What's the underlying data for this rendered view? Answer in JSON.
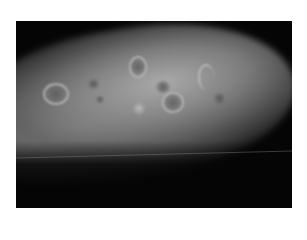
{
  "image": {
    "subject": "grayscale clinical photograph of limb with multiple skin lesions",
    "border_color": "#ffffff",
    "background_color": "#050505",
    "skin_tone": "#a0a0a0",
    "lesions": [
      {
        "type": "ring",
        "label": "annular lesion left"
      },
      {
        "type": "dark",
        "label": "dark macule"
      },
      {
        "type": "dark",
        "label": "small dark spot"
      },
      {
        "type": "ring",
        "label": "crusted lesion top"
      },
      {
        "type": "dark",
        "label": "dark papule center"
      },
      {
        "type": "ring",
        "label": "annular lesion center"
      },
      {
        "type": "light",
        "label": "raised nodule"
      },
      {
        "type": "ring",
        "label": "crescent lesion right"
      },
      {
        "type": "dark",
        "label": "dark macule right"
      }
    ]
  }
}
